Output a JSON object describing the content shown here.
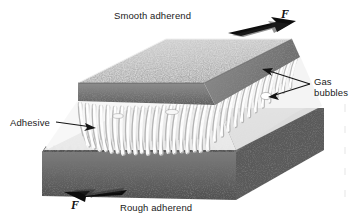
{
  "figure": {
    "background_color": "#ffffff",
    "labels": {
      "smooth_adherend": "Smooth adherend",
      "rough_adherend": "Rough adherend",
      "adhesive": "Adhesive",
      "gas_bubbles": "Gas\nbubbles",
      "gas_bubbles_line1": "Gas",
      "gas_bubbles_line2": "bubbles",
      "force_top": "F",
      "force_bottom": "F"
    },
    "colors": {
      "ink": "#1a1a1a",
      "block_top_face": "#b9b9b9",
      "block_front_face": "#6e6e6e",
      "block_side_face": "#8a8a8a",
      "adhesive_fiber": "#fbfbfb",
      "adhesive_shadow": "#9a9a9a",
      "arrow_fill": "#0d0d0d"
    },
    "elements": {
      "top_block_name": "smooth adherend block",
      "bottom_block_name": "rough adherend block",
      "adhesive_layer_name": "stretched adhesive fibrils",
      "force_arrow_top_direction": "right",
      "force_arrow_bottom_direction": "left",
      "gas_bubble_leader_count": "2"
    }
  }
}
